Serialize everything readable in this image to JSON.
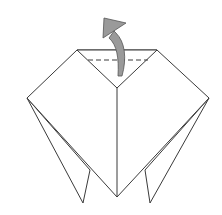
{
  "diagram": {
    "stroke_color": "#3a3a3a",
    "arrow_fill": "#9a9a9a",
    "arrow_stroke": "#555555",
    "fold_line_type": "dashed",
    "arrow_direction": "up"
  }
}
